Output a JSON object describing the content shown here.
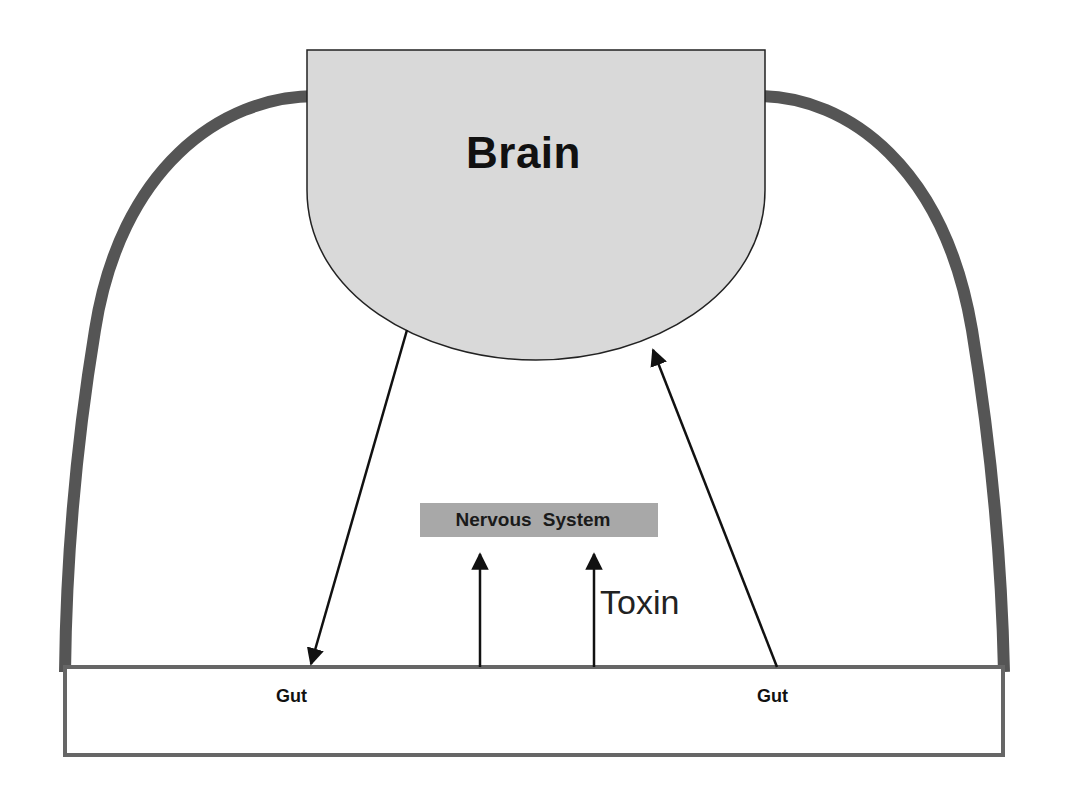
{
  "diagram": {
    "colors": {
      "background": "#ffffff",
      "brain_fill": "#d9d9d9",
      "outline": "#222222",
      "nerve_arc": "#555555",
      "gut_border": "#666666",
      "ns_box_fill": "#a8a8a8",
      "arrow": "#111111"
    },
    "nodes": {
      "brain": {
        "label": "Brain"
      },
      "nervous_system": {
        "label": "Nervous  System"
      },
      "gut_left": {
        "label": "Gut"
      },
      "gut_right": {
        "label": "Gut"
      },
      "toxin": {
        "label": "Toxin"
      }
    },
    "edges": [
      {
        "from": "brain",
        "to": "gut_left",
        "type": "arrow"
      },
      {
        "from": "gut_right",
        "to": "brain",
        "type": "arrow"
      },
      {
        "from": "gut",
        "to": "nervous_system",
        "type": "arrow"
      },
      {
        "from": "gut",
        "to": "nervous_system",
        "type": "arrow",
        "label": "Toxin"
      },
      {
        "from": "brain",
        "to": "gut",
        "type": "arc-left"
      },
      {
        "from": "brain",
        "to": "gut",
        "type": "arc-right"
      }
    ]
  }
}
